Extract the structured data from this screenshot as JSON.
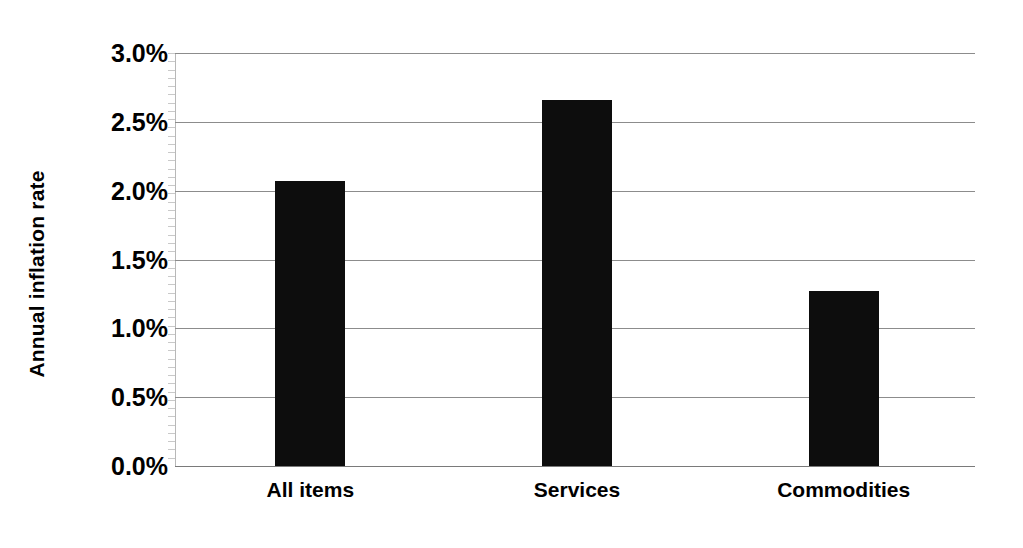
{
  "chart_data": {
    "type": "bar",
    "title": "",
    "subtitle": "",
    "xlabel": "",
    "ylabel": "Annual inflation rate",
    "categories": [
      "All items",
      "Services",
      "Commodities"
    ],
    "values": [
      2.07,
      2.66,
      1.27
    ],
    "value_labels": [
      "2.07%",
      "2.66%",
      "1.27%"
    ],
    "ylim": [
      0,
      3.0
    ],
    "ytick_values": [
      0.0,
      0.5,
      1.0,
      1.5,
      2.0,
      2.5,
      3.0
    ],
    "ytick_labels": [
      "0.0%",
      "0.5%",
      "1.0%",
      "1.5%",
      "2.0%",
      "2.5%",
      "3.0%"
    ],
    "grid": true,
    "grid_axis": "y",
    "legend": false,
    "legend_position": "none",
    "bar_color": "#0d0d0d",
    "gridline_color": "#8c8c8c",
    "background_color": "#ffffff",
    "text_color": "#000000",
    "series": [
      {
        "name": "Annual inflation rate",
        "values": [
          2.07,
          2.66,
          1.27
        ]
      }
    ],
    "annotations": []
  }
}
